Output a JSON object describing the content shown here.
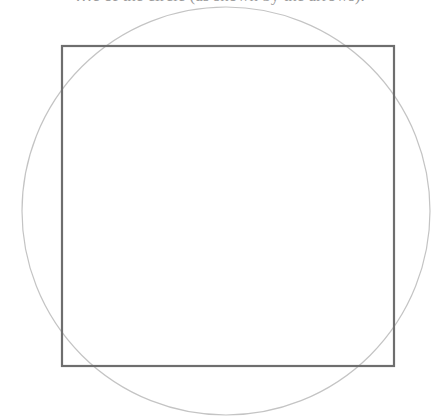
{
  "caption_fragment": "…e of the circle (as shown by the arrows).",
  "diagram": {
    "shapes": [
      {
        "type": "circle",
        "name": "circumscribed-circle",
        "stroke": "#c4c4c4"
      },
      {
        "type": "square",
        "name": "square",
        "stroke": "#6e6e6e"
      }
    ]
  }
}
